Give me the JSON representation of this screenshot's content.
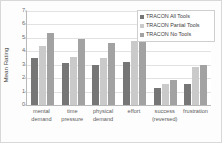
{
  "chart_data": {
    "type": "bar",
    "title": "",
    "xlabel": "",
    "ylabel": "Mean Rating",
    "ylim": [
      0,
      7
    ],
    "yticks": [
      0,
      1,
      2,
      3,
      4,
      5,
      6,
      7
    ],
    "grid": true,
    "legend_position": "top-right",
    "categories": [
      "mental demand",
      "time pressure",
      "physical demand",
      "effort",
      "success (reversed)",
      "frustration"
    ],
    "category_lines": [
      [
        "mental",
        "demand"
      ],
      [
        "time",
        "pressure"
      ],
      [
        "physical",
        "demand"
      ],
      [
        "effort",
        ""
      ],
      [
        "success",
        "(reversed)"
      ],
      [
        "frustration",
        ""
      ]
    ],
    "series": [
      {
        "name": "TRACON All Tools",
        "color": "#767676",
        "values": [
          3.5,
          3.1,
          3.0,
          3.2,
          1.25,
          1.6
        ]
      },
      {
        "name": "TRACON Partial Tools",
        "color": "#cacaca",
        "values": [
          4.4,
          3.55,
          3.5,
          4.75,
          1.55,
          2.8
        ]
      },
      {
        "name": "TRACON No Tools",
        "color": "#a2a2a2",
        "values": [
          5.35,
          4.9,
          4.65,
          5.3,
          1.9,
          3.0
        ]
      }
    ]
  }
}
